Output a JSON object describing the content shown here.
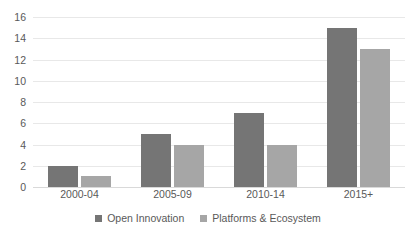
{
  "chart_data": {
    "type": "bar",
    "title": "",
    "subtitle": "",
    "xlabel": "",
    "ylabel": "",
    "categories": [
      "2000-04",
      "2005-09",
      "2010-14",
      "2015+"
    ],
    "series": [
      {
        "name": "Open Innovation",
        "values": [
          2,
          5,
          7,
          15
        ],
        "color": "#757575"
      },
      {
        "name": "Platforms & Ecosystem",
        "values": [
          1,
          4,
          4,
          13
        ],
        "color": "#a6a6a6"
      }
    ],
    "ylim": [
      0,
      16
    ],
    "ytick_step": 2,
    "yticks": [
      16,
      14,
      12,
      10,
      8,
      6,
      4,
      2,
      0
    ],
    "ytick_labels": [
      "16",
      "14",
      "12",
      "10",
      "8",
      "6",
      "4",
      "2",
      "0"
    ],
    "grid": true,
    "grid_axis": "y",
    "legend": true,
    "legend_position": "bottom-center",
    "background_color": "#ffffff",
    "text_color": "#595959",
    "gridline_color": "#e8e8e8"
  }
}
